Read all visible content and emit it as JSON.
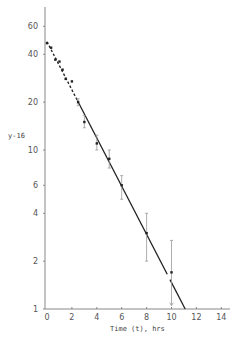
{
  "chart_data": {
    "type": "scatter",
    "title": "",
    "xlabel": "Time (t),  hrs",
    "ylabel": "y-16",
    "x_ticks": [
      0,
      2,
      4,
      6,
      8,
      10,
      12,
      14
    ],
    "y_ticks": [
      1,
      2,
      4,
      6,
      10,
      20,
      40,
      60
    ],
    "y_scale": "log",
    "xlim": [
      0,
      14.5
    ],
    "ylim": [
      1,
      75
    ],
    "grid": false,
    "legend": null,
    "series": [
      {
        "name": "observations",
        "points": [
          {
            "x": 0.0,
            "y": 47,
            "err_low": null,
            "err_high": null
          },
          {
            "x": 0.33,
            "y": 44,
            "err_low": null,
            "err_high": null
          },
          {
            "x": 0.67,
            "y": 37,
            "err_low": null,
            "err_high": null
          },
          {
            "x": 1.0,
            "y": 36,
            "err_low": null,
            "err_high": null
          },
          {
            "x": 1.25,
            "y": 32,
            "err_low": null,
            "err_high": null
          },
          {
            "x": 1.5,
            "y": 28,
            "err_low": null,
            "err_high": null
          },
          {
            "x": 2.0,
            "y": 27,
            "err_low": null,
            "err_high": null
          },
          {
            "x": 2.5,
            "y": 20,
            "err_low": 19,
            "err_high": 21
          },
          {
            "x": 3.0,
            "y": 15,
            "err_low": 13.8,
            "err_high": 16.5
          },
          {
            "x": 4.0,
            "y": 11,
            "err_low": 10,
            "err_high": 12.4
          },
          {
            "x": 5.0,
            "y": 8.8,
            "err_low": 7.7,
            "err_high": 10
          },
          {
            "x": 6.0,
            "y": 6.0,
            "err_low": 4.9,
            "err_high": 6.9
          },
          {
            "x": 8.0,
            "y": 3.0,
            "err_low": 2.0,
            "err_high": 4.0
          },
          {
            "x": 10.0,
            "y": 1.7,
            "err_low": 1.05,
            "err_high": 2.7,
            "arrow_down": true
          }
        ]
      },
      {
        "name": "fitted line",
        "type": "line",
        "x": [
          0,
          11.1
        ],
        "y": [
          48,
          1
        ]
      }
    ]
  },
  "axes": {
    "x_title": "Time (t),  hrs",
    "y_title": "y-16",
    "x_tick_labels": [
      "0",
      "2",
      "4",
      "6",
      "8",
      "10",
      "12",
      "14"
    ],
    "y_tick_labels": [
      "1",
      "2",
      "4",
      "6",
      "10",
      "20",
      "40",
      "60"
    ]
  },
  "colors": {
    "axis": "#888888",
    "points": "#222222",
    "line": "#222222",
    "error_bars": "#999999"
  }
}
